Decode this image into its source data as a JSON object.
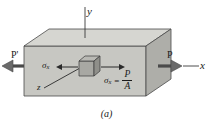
{
  "figure": {
    "caption": "(a)",
    "axes": {
      "y_label": "y",
      "x_label": "x",
      "z_label": "z"
    },
    "forces": {
      "left_label": "P'",
      "right_label": "P"
    },
    "stress": {
      "left_sigma_symbol": "σ",
      "left_sigma_subscript": "x",
      "right_sigma_symbol": "σ",
      "right_sigma_subscript": "x",
      "equals": "=",
      "numerator": "P",
      "denominator": "A"
    },
    "colors": {
      "top_face": "#d6d6d1",
      "front_face": "#c7c7c2",
      "right_face": "#aeaea9",
      "element_top": "#b9b9b4",
      "element_front": "#a8a8a3",
      "element_right": "#8f8f8a",
      "outline": "#4a4a4a",
      "ink": "#1a1a1a",
      "background": "#ffffff"
    }
  }
}
